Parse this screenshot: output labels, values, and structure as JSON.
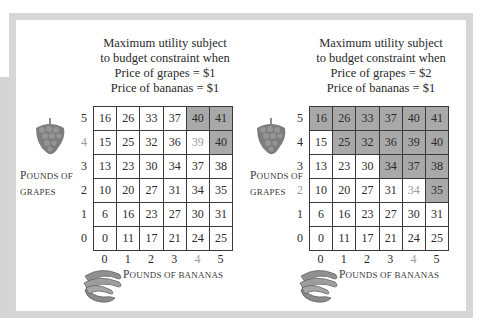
{
  "panels": [
    {
      "title_lines": [
        "Maximum utility subject",
        "to budget constraint when",
        "Price of grapes = $1",
        "Price of bananas = $1"
      ],
      "y_axis_label": {
        "first": "P",
        "rest": "ounds of",
        "line2": "grapes"
      },
      "x_axis_label": {
        "first": "P",
        "rest": "ounds of bananas"
      },
      "row_labels": [
        "5",
        "4",
        "3",
        "2",
        "1",
        "0"
      ],
      "col_labels": [
        "0",
        "1",
        "2",
        "3",
        "4",
        "5"
      ],
      "highlight_row": "4",
      "highlight_col": "4",
      "shaded_color": "#a9a9a9"
    },
    {
      "title_lines": [
        "Maximum utility subject",
        "to budget constraint when",
        "Price of grapes = $2",
        "Price of bananas = $1"
      ],
      "y_axis_label": {
        "first": "P",
        "rest": "ounds of",
        "line2": "grapes"
      },
      "x_axis_label": {
        "first": "P",
        "rest": "ounds of bananas"
      },
      "row_labels": [
        "5",
        "4",
        "3",
        "2",
        "1",
        "0"
      ],
      "col_labels": [
        "0",
        "1",
        "2",
        "3",
        "4",
        "5"
      ],
      "highlight_row": "2",
      "highlight_col": "4",
      "shaded_color": "#a9a9a9"
    }
  ],
  "chart_data": [
    {
      "type": "table",
      "title": "Maximum utility subject to budget constraint when Price of grapes = $1, Price of bananas = $1",
      "xlabel": "Pounds of bananas",
      "ylabel": "Pounds of grapes",
      "x": [
        0,
        1,
        2,
        3,
        4,
        5
      ],
      "y": [
        5,
        4,
        3,
        2,
        1,
        0
      ],
      "values": [
        [
          16,
          26,
          33,
          37,
          40,
          41
        ],
        [
          15,
          25,
          32,
          36,
          39,
          40
        ],
        [
          13,
          23,
          30,
          34,
          37,
          38
        ],
        [
          10,
          20,
          27,
          31,
          34,
          35
        ],
        [
          6,
          16,
          23,
          27,
          30,
          31
        ],
        [
          0,
          11,
          17,
          21,
          24,
          25
        ]
      ],
      "shaded": [
        [
          false,
          false,
          false,
          false,
          true,
          true
        ],
        [
          false,
          false,
          false,
          false,
          false,
          true
        ],
        [
          false,
          false,
          false,
          false,
          false,
          false
        ],
        [
          false,
          false,
          false,
          false,
          false,
          false
        ],
        [
          false,
          false,
          false,
          false,
          false,
          false
        ],
        [
          false,
          false,
          false,
          false,
          false,
          false
        ]
      ],
      "optimum": {
        "grapes": 4,
        "bananas": 4,
        "utility": 39
      }
    },
    {
      "type": "table",
      "title": "Maximum utility subject to budget constraint when Price of grapes = $2, Price of bananas = $1",
      "xlabel": "Pounds of bananas",
      "ylabel": "Pounds of grapes",
      "x": [
        0,
        1,
        2,
        3,
        4,
        5
      ],
      "y": [
        5,
        4,
        3,
        2,
        1,
        0
      ],
      "values": [
        [
          16,
          26,
          33,
          37,
          40,
          41
        ],
        [
          15,
          25,
          32,
          36,
          39,
          40
        ],
        [
          13,
          23,
          30,
          34,
          37,
          38
        ],
        [
          10,
          20,
          27,
          31,
          34,
          35
        ],
        [
          6,
          16,
          23,
          27,
          30,
          31
        ],
        [
          0,
          11,
          17,
          21,
          24,
          25
        ]
      ],
      "shaded": [
        [
          true,
          true,
          true,
          true,
          true,
          true
        ],
        [
          false,
          true,
          true,
          true,
          true,
          true
        ],
        [
          false,
          false,
          false,
          true,
          true,
          true
        ],
        [
          false,
          false,
          false,
          false,
          false,
          true
        ],
        [
          false,
          false,
          false,
          false,
          false,
          false
        ],
        [
          false,
          false,
          false,
          false,
          false,
          false
        ]
      ],
      "optimum": {
        "grapes": 2,
        "bananas": 4,
        "utility": 34
      }
    }
  ]
}
